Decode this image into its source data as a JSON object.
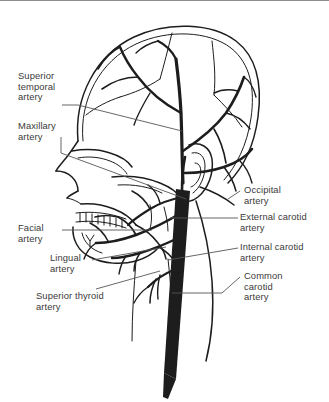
{
  "figure": {
    "background_color": "#ffffff",
    "ink_color": "#1d1d1d",
    "label_color": "#3a3a3a",
    "leader_color": "#55565a",
    "border_color": "#8d8d8d",
    "width": 329,
    "height": 402
  },
  "labels": {
    "superior_temporal": "Superior\ntemporal\nartery",
    "maxillary": "Maxillary\nartery",
    "facial": "Facial\nartery",
    "lingual": "Lingual\nartery",
    "superior_thyroid": "Superior thyroid\nartery",
    "occipital": "Occipital\nartery",
    "external_carotid": "External carotid\nartery",
    "internal_carotid": "Internal carotid\nartery",
    "common_carotid": "Common\ncarotid\nartery"
  },
  "structures": {
    "cranium": "cranium-outline",
    "ear": "ear-outline",
    "mandible": "mandible-outline",
    "teeth": "teeth-row",
    "orbit": "eye-socket",
    "nasal": "nasal-profile",
    "carotid_trunk": "common-carotid-trunk"
  }
}
